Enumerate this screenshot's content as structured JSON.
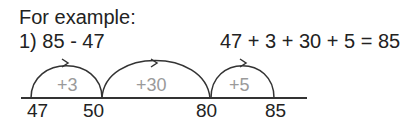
{
  "heading": "For example:",
  "problem": "1) 85 - 47",
  "equation": "47 + 3 + 30 + 5 = 85",
  "number_line": {
    "points": [
      "47",
      "50",
      "80",
      "85"
    ],
    "jumps": [
      "+3",
      "+30",
      "+5"
    ]
  }
}
